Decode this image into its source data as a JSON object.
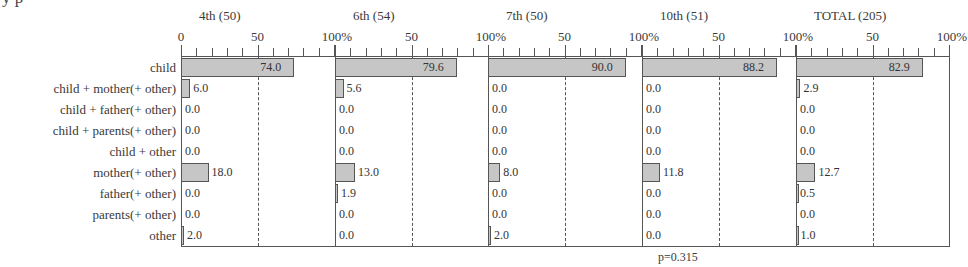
{
  "title_fragment": "y    p",
  "chart_data": {
    "type": "bar",
    "orientation": "horizontal",
    "title": "",
    "categories": [
      "child",
      "child + mother(+ other)",
      "child + father(+ other)",
      "child + parents(+ other)",
      "child + other",
      "mother(+ other)",
      "father(+ other)",
      "parents(+ other)",
      "other"
    ],
    "series": [
      {
        "name": "4th (50)",
        "values": [
          74.0,
          6.0,
          0.0,
          0.0,
          0.0,
          18.0,
          0.0,
          0.0,
          2.0
        ],
        "labels": [
          "74.0",
          "6.0",
          "0.0",
          "0.0",
          "0.0",
          "18.0",
          "0.0",
          "0.0",
          "2.0"
        ]
      },
      {
        "name": "6th (54)",
        "values": [
          79.6,
          5.6,
          0.0,
          0.0,
          0.0,
          13.0,
          1.9,
          0.0,
          0.0
        ],
        "labels": [
          "79.6",
          "5.6",
          "0.0",
          "0.0",
          "0.0",
          "13.0",
          "1.9",
          "0.0",
          "0.0"
        ]
      },
      {
        "name": "7th (50)",
        "values": [
          90.0,
          0.0,
          0.0,
          0.0,
          0.0,
          8.0,
          0.0,
          0.0,
          2.0
        ],
        "labels": [
          "90.0",
          "0.0",
          "0.0",
          "0.0",
          "0.0",
          "8.0",
          "0.0",
          "0.0",
          "2.0"
        ]
      },
      {
        "name": "10th (51)",
        "values": [
          88.2,
          0.0,
          0.0,
          0.0,
          0.0,
          11.8,
          0.0,
          0.0,
          0.0
        ],
        "labels": [
          "88.2",
          "0.0",
          "0.0",
          "0.0",
          "0.0",
          "11.8",
          "0.0",
          "0.0",
          "0.0"
        ]
      },
      {
        "name": "TOTAL (205)",
        "values": [
          82.9,
          2.9,
          0.0,
          0.0,
          0.0,
          12.7,
          0.5,
          0.0,
          1.0
        ],
        "labels": [
          "82.9",
          "2.9",
          "0.0",
          "0.0",
          "0.0",
          "12.7",
          "0.5",
          "0.0",
          "1.0"
        ]
      }
    ],
    "xlim": [
      0,
      100
    ],
    "tick_labels": [
      "0",
      "50",
      "100%"
    ],
    "tick_step": 10,
    "reference_line": 50,
    "xlabel": "",
    "ylabel": "",
    "grid": false,
    "legend": null,
    "annotation": "p=0.315",
    "bar_color": "#c6c6c6",
    "bar_edge_color": "#555555"
  }
}
